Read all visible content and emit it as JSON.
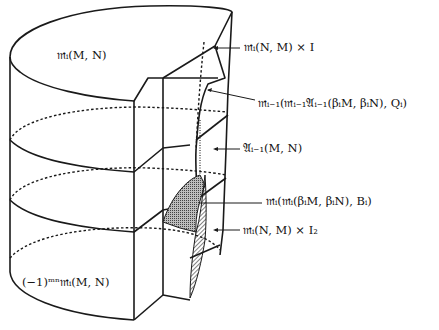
{
  "figure": {
    "type": "3d-cylinder-homotopy-diagram",
    "labels": {
      "top_face": "𝔪ᵢ(M, N)",
      "bottom_face": "(−1)ᵐⁿ𝔪ᵢ(M, N)",
      "right_1": "𝔪ᵢ(N, M) × I",
      "right_2": "𝔪ᵢ₋₁(𝔪ᵢ₋₁𝔄ᵢ₋₁(βᵢM, βᵢN), Qᵢ)",
      "right_3": "𝔄ᵢ₋₁(M, N)",
      "right_4": "𝔪ᵢ(𝔪ᵢ(βᵢM, βᵢN), Bᵢ)",
      "right_5": "𝔪ᵢ(N, M) × I₂"
    },
    "colors": {
      "ink": "#1a1a1a",
      "background": "#ffffff",
      "shaded": "#8a8a8a"
    }
  }
}
